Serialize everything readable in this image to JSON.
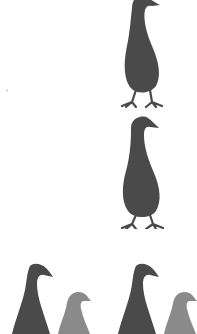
{
  "scene": {
    "title": "Bird silhouettes",
    "background": "#ffffff",
    "colors": {
      "dark_bird": "#4a4a4a",
      "light_bird": "#8a8a8a"
    }
  },
  "birds": [
    {
      "id": "bird-top",
      "tone": "dark",
      "full_body": true,
      "label": "Standing bird (top)"
    },
    {
      "id": "bird-middle",
      "tone": "dark",
      "full_body": true,
      "label": "Standing bird (middle)"
    },
    {
      "id": "bird-bottom-left-large",
      "tone": "dark",
      "full_body": false,
      "label": "Large bird head and neck (bottom left)"
    },
    {
      "id": "bird-bottom-left-small",
      "tone": "light",
      "full_body": false,
      "label": "Small bird head (bottom left)"
    },
    {
      "id": "bird-bottom-right-large",
      "tone": "dark",
      "full_body": false,
      "label": "Large bird head and neck (bottom right)"
    },
    {
      "id": "bird-bottom-right-small",
      "tone": "light",
      "full_body": false,
      "label": "Small bird head (bottom right)"
    }
  ]
}
